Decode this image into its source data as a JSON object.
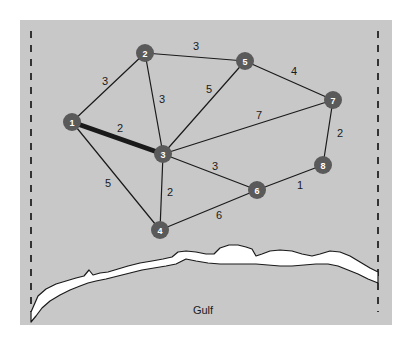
{
  "figure": {
    "panel": {
      "background_color": "#c8c8c8",
      "x": 20,
      "y": 20,
      "width": 372,
      "height": 305
    },
    "page_background_color": "#ffffff",
    "boundary_color": "#333333",
    "edge_color": "#1a1a1a",
    "node_fill_color": "#5a5a5a",
    "node_text_color": "#ffffff",
    "coast_fill_color": "#ffffff",
    "coast_outline_color": "#1a1a1a"
  },
  "labels": {
    "gulf": "Gulf"
  },
  "chart_data": {
    "type": "diagram",
    "title": "",
    "nodes": [
      {
        "id": "1",
        "label": "1",
        "x": 72,
        "y": 122
      },
      {
        "id": "2",
        "label": "2",
        "x": 145,
        "y": 53
      },
      {
        "id": "3",
        "label": "3",
        "x": 163,
        "y": 154
      },
      {
        "id": "4",
        "label": "4",
        "x": 160,
        "y": 230
      },
      {
        "id": "5",
        "label": "5",
        "x": 245,
        "y": 61
      },
      {
        "id": "6",
        "label": "6",
        "x": 257,
        "y": 190
      },
      {
        "id": "7",
        "label": "7",
        "x": 333,
        "y": 100
      },
      {
        "id": "8",
        "label": "8",
        "x": 323,
        "y": 165
      }
    ],
    "node_radius": 9,
    "edges": [
      {
        "from": "1",
        "to": "2",
        "weight": 3,
        "label": "3",
        "lx": 105,
        "ly": 82,
        "highlight": false
      },
      {
        "from": "1",
        "to": "3",
        "weight": 2,
        "label": "2",
        "lx": 120,
        "ly": 129,
        "highlight": true
      },
      {
        "from": "1",
        "to": "4",
        "weight": 5,
        "label": "5",
        "lx": 108,
        "ly": 184,
        "highlight": false
      },
      {
        "from": "2",
        "to": "3",
        "weight": 3,
        "label": "3",
        "lx": 162,
        "ly": 100,
        "highlight": false
      },
      {
        "from": "2",
        "to": "5",
        "weight": 3,
        "label": "3",
        "lx": 196,
        "ly": 47,
        "highlight": false
      },
      {
        "from": "3",
        "to": "4",
        "weight": 2,
        "label": "2",
        "lx": 170,
        "ly": 193,
        "highlight": false
      },
      {
        "from": "3",
        "to": "5",
        "weight": 5,
        "label": "5",
        "lx": 209,
        "ly": 90,
        "highlight": false
      },
      {
        "from": "3",
        "to": "6",
        "weight": 3,
        "label": "3",
        "lx": 215,
        "ly": 167,
        "highlight": false
      },
      {
        "from": "3",
        "to": "7",
        "weight": 7,
        "label": "7",
        "lx": 259,
        "ly": 116,
        "highlight": false
      },
      {
        "from": "4",
        "to": "6",
        "weight": 6,
        "label": "6",
        "lx": 219,
        "ly": 216,
        "highlight": false
      },
      {
        "from": "5",
        "to": "7",
        "weight": 4,
        "label": "4",
        "lx": 294,
        "ly": 72,
        "highlight": false
      },
      {
        "from": "6",
        "to": "8",
        "weight": 1,
        "label": "1",
        "lx": 300,
        "ly": 186,
        "highlight": false
      },
      {
        "from": "7",
        "to": "8",
        "weight": 2,
        "label": "2",
        "lx": 340,
        "ly": 134,
        "highlight": false
      }
    ],
    "borders": [
      {
        "name": "left-border",
        "x": 31,
        "y1": 31,
        "y2": 312
      },
      {
        "name": "right-border",
        "x": 378,
        "y1": 31,
        "y2": 312
      }
    ],
    "gulf_label": {
      "text": "Gulf",
      "x": 203,
      "y": 311
    }
  }
}
